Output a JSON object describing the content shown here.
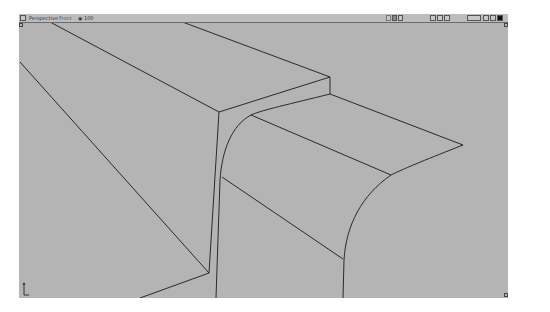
{
  "viewport": {
    "label": "Perspective",
    "mode": "Front",
    "zoom_level": "100"
  },
  "toolbar_left": {
    "menu_icon": "viewport-menu-icon"
  },
  "toolbar_right": {
    "groups": [
      [
        "camera-icon",
        "render-icon",
        "frame-icon"
      ],
      [
        "grid-icon",
        "snap-icon",
        "nav-icon"
      ],
      [
        "display-button",
        "maximize-icon",
        "restore-icon",
        "close-icon"
      ]
    ],
    "display_label": "Shade"
  },
  "axis_indicator": "xyz-axis-icon",
  "colors": {
    "viewport_bg": "#b4b4b4",
    "edge_line": "#2a2a2a",
    "header_bg": "#bdbdbd"
  },
  "scene_edges": {
    "lines": [
      [
        50,
        22,
        219,
        112
      ],
      [
        161,
        14,
        330,
        77
      ],
      [
        219,
        112,
        330,
        77
      ],
      [
        330,
        77,
        330,
        94
      ],
      [
        20,
        62,
        209,
        273
      ],
      [
        209,
        273,
        140,
        298
      ],
      [
        219,
        112,
        209,
        273
      ],
      [
        222,
        177,
        343,
        259
      ],
      [
        251,
        115,
        391,
        175
      ],
      [
        330,
        94,
        463,
        145
      ]
    ]
  }
}
